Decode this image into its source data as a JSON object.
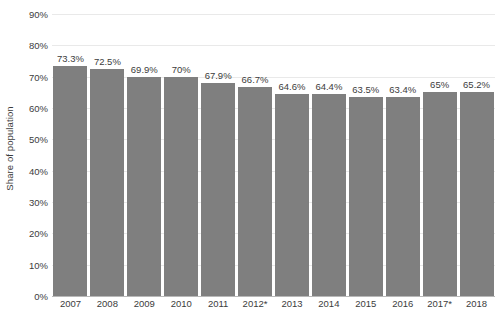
{
  "chart_data": {
    "type": "bar",
    "title": "",
    "subtitle": "",
    "xlabel": "",
    "ylabel": "Share of population",
    "categories": [
      "2007",
      "2008",
      "2009",
      "2010",
      "2011",
      "2012*",
      "2013",
      "2014",
      "2015",
      "2016",
      "2017*",
      "2018"
    ],
    "values": [
      73.3,
      72.5,
      69.9,
      70,
      67.9,
      66.7,
      64.6,
      64.4,
      63.5,
      63.4,
      65,
      65.2
    ],
    "data_labels": [
      "73.3%",
      "72.5%",
      "69.9%",
      "70%",
      "67.9%",
      "66.7%",
      "64.6%",
      "64.4%",
      "63.5%",
      "63.4%",
      "65%",
      "65.2%"
    ],
    "ylim": [
      0,
      90
    ],
    "ytick_values": [
      0,
      10,
      20,
      30,
      40,
      50,
      60,
      70,
      80,
      90
    ],
    "ytick_labels": [
      "0%",
      "10%",
      "20%",
      "30%",
      "40%",
      "50%",
      "60%",
      "70%",
      "80%",
      "90%"
    ],
    "grid": true,
    "legend": false,
    "legend_position": "none",
    "series": [
      {
        "name": "Share of population",
        "values": [
          73.3,
          72.5,
          69.9,
          70,
          67.9,
          66.7,
          64.6,
          64.4,
          63.5,
          63.4,
          65,
          65.2
        ]
      }
    ],
    "annotations": []
  },
  "colors": {
    "bar": "#7f7f7f",
    "gridline": "#e9e9e9",
    "axis": "#b8b8b8",
    "text": "#3c3c3c",
    "background": "#ffffff"
  }
}
